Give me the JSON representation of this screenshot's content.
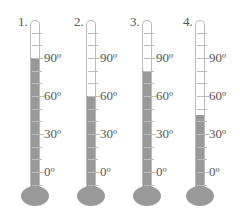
{
  "chart_data": {
    "type": "diagram",
    "title": "",
    "scale_labels": [
      "90º",
      "60º",
      "30º",
      "0º"
    ],
    "thermometers": [
      {
        "label": "1.",
        "reading": 90
      },
      {
        "label": "2.",
        "reading": 60
      },
      {
        "label": "3.",
        "reading": 80
      },
      {
        "label": "4.",
        "reading": 45
      }
    ]
  },
  "thermometers": [
    {
      "label": "1."
    },
    {
      "label": "2."
    },
    {
      "label": "3."
    },
    {
      "label": "4."
    }
  ],
  "scale": {
    "t90": "90º",
    "t60": "60º",
    "t30": "30º",
    "t0": "0º"
  },
  "colors": {
    "mercury": "#999999",
    "tube_border": "#bbbbbb",
    "text": "#555555"
  }
}
